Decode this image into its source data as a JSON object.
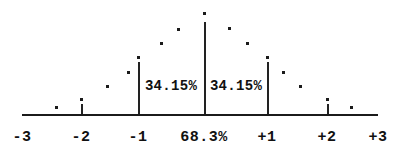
{
  "figure": {
    "background_color": "#ffffff",
    "ink_color": "#1b1b1b"
  },
  "axis": {
    "y_pixel": 114,
    "x_start": 22,
    "x_end": 378,
    "thickness": 2,
    "labels": [
      {
        "text": "-3",
        "x": 22,
        "name": "axis-label-minus-3"
      },
      {
        "text": "-2",
        "x": 81,
        "name": "axis-label-minus-2"
      },
      {
        "text": "-1",
        "x": 138,
        "name": "axis-label-minus-1"
      },
      {
        "text": "68.3%",
        "x": 204,
        "name": "axis-label-center-percent"
      },
      {
        "text": "+1",
        "x": 267,
        "name": "axis-label-plus-1"
      },
      {
        "text": "+2",
        "x": 327,
        "name": "axis-label-plus-2"
      },
      {
        "text": "+3",
        "x": 378,
        "name": "axis-label-plus-3"
      }
    ],
    "label_y": 130
  },
  "region_labels": [
    {
      "text": "34.15%",
      "x": 171,
      "y": 79,
      "name": "region-label-left-34"
    },
    {
      "text": "34.15%",
      "x": 236,
      "y": 79,
      "name": "region-label-right-34"
    }
  ],
  "stems": [
    {
      "x": 81,
      "top": 104,
      "name": "stem-minus-2"
    },
    {
      "x": 138,
      "top": 62,
      "name": "stem-minus-1"
    },
    {
      "x": 204,
      "top": 22,
      "name": "stem-center"
    },
    {
      "x": 267,
      "top": 62,
      "name": "stem-plus-1"
    },
    {
      "x": 327,
      "top": 104,
      "name": "stem-plus-2"
    }
  ],
  "dots": [
    {
      "x": 56,
      "y": 107
    },
    {
      "x": 81,
      "y": 99
    },
    {
      "x": 107,
      "y": 86
    },
    {
      "x": 128,
      "y": 72
    },
    {
      "x": 138,
      "y": 57
    },
    {
      "x": 161,
      "y": 43
    },
    {
      "x": 178,
      "y": 29
    },
    {
      "x": 204,
      "y": 13
    },
    {
      "x": 229,
      "y": 28
    },
    {
      "x": 247,
      "y": 43
    },
    {
      "x": 267,
      "y": 57
    },
    {
      "x": 283,
      "y": 72
    },
    {
      "x": 300,
      "y": 86
    },
    {
      "x": 327,
      "y": 99
    },
    {
      "x": 351,
      "y": 107
    }
  ],
  "chart_data": {
    "type": "bar",
    "xlabel": "Standard deviations from the mean",
    "ylabel": "",
    "xlim": [
      -3,
      3
    ],
    "grid": false,
    "legend": false,
    "categories": [
      "-3",
      "-2",
      "-1",
      "0",
      "+1",
      "+2",
      "+3"
    ],
    "tick_labels": [
      "-3",
      "-2",
      "-1",
      "68.3%",
      "+1",
      "+2",
      "+3"
    ],
    "annotations": [
      {
        "text": "34.15%",
        "range": [
          -1,
          0
        ],
        "note": "area between -1 sigma and the mean"
      },
      {
        "text": "34.15%",
        "range": [
          0,
          1
        ],
        "note": "area between the mean and +1 sigma"
      },
      {
        "text": "68.3%",
        "range": [
          -1,
          1
        ],
        "note": "total area within one standard deviation"
      }
    ],
    "series": [
      {
        "name": "density (relative height)",
        "x": [
          -3.0,
          -2.5,
          -2.0,
          -1.5,
          -1.2,
          -1.0,
          -0.75,
          -0.5,
          0.0,
          0.5,
          0.75,
          1.0,
          1.2,
          1.5,
          2.0,
          2.5,
          3.0
        ],
        "values": [
          0.01,
          0.07,
          0.14,
          0.27,
          0.42,
          0.57,
          0.72,
          0.86,
          1.0,
          0.86,
          0.72,
          0.57,
          0.42,
          0.27,
          0.14,
          0.07,
          0.01
        ]
      }
    ]
  }
}
